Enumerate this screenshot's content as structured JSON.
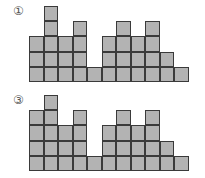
{
  "figures": [
    {
      "label": "①",
      "column_heights": [
        3,
        5,
        3,
        4,
        1,
        3,
        4,
        3,
        4,
        2,
        1
      ]
    },
    {
      "label": "③",
      "column_heights": [
        4,
        5,
        3,
        4,
        1,
        3,
        4,
        3,
        4,
        2,
        1
      ]
    }
  ],
  "style": {
    "cell_fill": "#b3b3b3",
    "cell_border": "#3a3a3a"
  }
}
